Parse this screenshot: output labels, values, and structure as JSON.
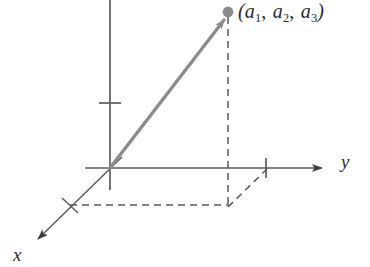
{
  "figure": {
    "kind": "3d-coordinate-axes-vector-diagram",
    "background_color": "#ffffff",
    "axis_color": "#555555",
    "vector_color": "#8c8c8c",
    "dashed_color": "#5a5a5a",
    "text_color": "#2b2b2b",
    "labels": {
      "x_axis": "x",
      "y_axis": "y",
      "point_open_paren": "(",
      "point_close_paren": ")",
      "point_component_1": "a",
      "point_component_1_sub": "1",
      "point_component_2": "a",
      "point_component_2_sub": "2",
      "point_component_3": "a",
      "point_component_3_sub": "3",
      "point_separator": ",",
      "point_full": "(a1, a2, a3)"
    },
    "geometry": {
      "origin": {
        "x": 110,
        "y": 168
      },
      "point": {
        "x": 228,
        "y": 12
      },
      "z_axis_top": {
        "x": 110,
        "y": 0
      },
      "z_axis_bottom": {
        "x": 110,
        "y": 190
      },
      "z_axis_tick_y": 103,
      "y_axis_left": {
        "x": 85,
        "y": 168
      },
      "y_axis_tip": {
        "x": 330,
        "y": 168
      },
      "y_axis_tick_x": 266,
      "x_axis_tip": {
        "x": 30,
        "y": 247
      },
      "x_axis_tick": {
        "x": 70,
        "y": 205
      },
      "projection_corner": {
        "x": 228,
        "y": 206
      },
      "dash_pattern": "7 5"
    }
  }
}
